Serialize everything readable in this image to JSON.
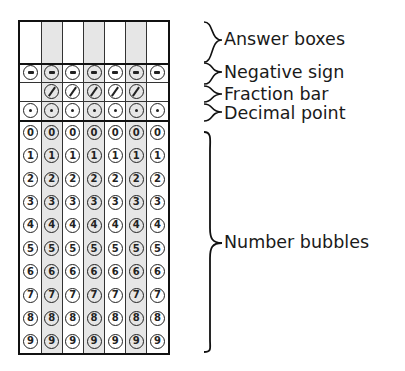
{
  "grid": {
    "columns": 7,
    "shaded_columns": [
      1,
      3,
      5
    ],
    "answer_boxes": [
      "",
      "",
      "",
      "",
      "",
      "",
      ""
    ],
    "negative_row": {
      "symbol": "minus",
      "columns": [
        0,
        1,
        2,
        3,
        4,
        5,
        6
      ]
    },
    "fraction_row": {
      "symbol": "slash",
      "columns": [
        1,
        2,
        3,
        4,
        5
      ]
    },
    "decimal_row": {
      "symbol": "dot",
      "columns": [
        0,
        1,
        2,
        3,
        4,
        5,
        6
      ]
    },
    "digits": [
      "0",
      "1",
      "2",
      "3",
      "4",
      "5",
      "6",
      "7",
      "8",
      "9"
    ]
  },
  "labels": {
    "answer_boxes": "Answer boxes",
    "negative_sign": "Negative sign",
    "fraction_bar": "Fraction bar",
    "decimal_point": "Decimal point",
    "number_bubbles": "Number bubbles"
  },
  "colors": {
    "line": "#111111",
    "shade": "#e6e6e6",
    "text": "#1a1a1a"
  }
}
